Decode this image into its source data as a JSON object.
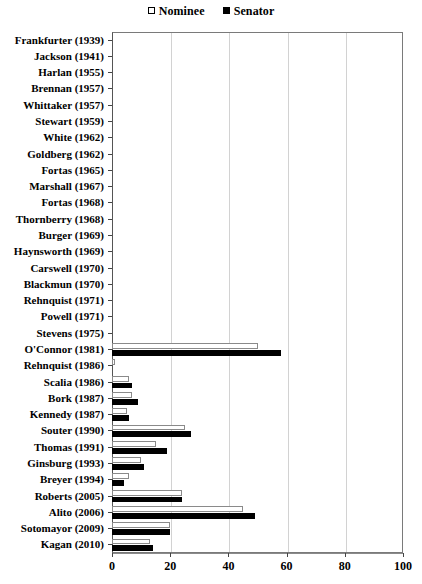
{
  "chart_data": {
    "type": "bar",
    "orientation": "horizontal",
    "title": "",
    "xlabel": "",
    "ylabel": "",
    "xlim": [
      0,
      100
    ],
    "xticks": [
      0,
      20,
      40,
      60,
      80,
      100
    ],
    "grid": true,
    "legend_position": "top-center",
    "legend": [
      {
        "label": "Nominee",
        "marker": "hollow-square"
      },
      {
        "label": "Senator",
        "marker": "filled-square"
      }
    ],
    "categories": [
      "Frankfurter (1939)",
      "Jackson (1941)",
      "Harlan (1955)",
      "Brennan (1957)",
      "Whittaker (1957)",
      "Stewart (1959)",
      "White (1962)",
      "Goldberg (1962)",
      "Fortas (1965)",
      "Marshall (1967)",
      "Fortas (1968)",
      "Thornberry (1968)",
      "Burger (1969)",
      "Haynsworth (1969)",
      "Carswell (1970)",
      "Blackmun (1970)",
      "Rehnquist (1971)",
      "Powell (1971)",
      "Stevens (1975)",
      "O'Connor (1981)",
      "Rehnquist (1986)",
      "Scalia (1986)",
      "Bork (1987)",
      "Kennedy (1987)",
      "Souter (1990)",
      "Thomas (1991)",
      "Ginsburg (1993)",
      "Breyer (1994)",
      "Roberts (2005)",
      "Alito (2006)",
      "Sotomayor (2009)",
      "Kagan (2010)"
    ],
    "series": [
      {
        "name": "Nominee",
        "values": [
          0,
          0,
          0,
          0,
          0,
          0,
          0,
          0,
          0,
          0,
          0,
          0,
          0,
          0,
          0,
          0,
          0,
          0,
          0,
          50,
          1,
          6,
          7,
          5,
          25,
          15,
          10,
          6,
          24,
          45,
          20,
          13
        ]
      },
      {
        "name": "Senator",
        "values": [
          0,
          0,
          0,
          0,
          0,
          0,
          0,
          0,
          0,
          0,
          0,
          0,
          0,
          0,
          0,
          0,
          0,
          0,
          0,
          58,
          0,
          7,
          9,
          6,
          27,
          19,
          11,
          4,
          24,
          49,
          20,
          14
        ]
      }
    ]
  }
}
